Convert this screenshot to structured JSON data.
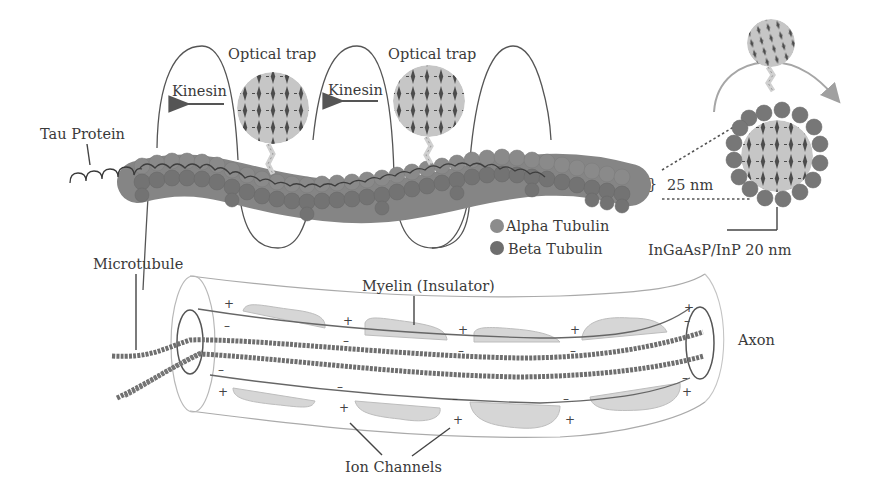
{
  "figure": {
    "labels": {
      "optical_trap_1": "Optical trap",
      "optical_trap_2": "Optical trap",
      "kinesin_1": "Kinesin",
      "kinesin_2": "Kinesin",
      "tau_protein": "Tau Protein",
      "microtubule": "Microtubule",
      "myelin": "Myelin (Insulator)",
      "axon": "Axon",
      "ion_channels": "Ion Channels",
      "dimension": "25 nm",
      "nanoparticle": "InGaAsP/InP 20 nm",
      "brace": "}"
    },
    "legend": [
      {
        "label": "Alpha Tubulin",
        "color": "#8c8c8c"
      },
      {
        "label": "Beta Tubulin",
        "color": "#6e6e6e"
      }
    ],
    "charges": {
      "plus": "+",
      "minus": "–"
    },
    "colors": {
      "tubulin_alpha": "#8c8c8c",
      "tubulin_beta": "#6e6e6e",
      "bead_fill": "#c8c8c8",
      "bead_dot": "#4a4a4a",
      "myelin_pad": "#d6d6d6",
      "arrow_light": "#9a9a9a",
      "line": "#555555"
    }
  }
}
